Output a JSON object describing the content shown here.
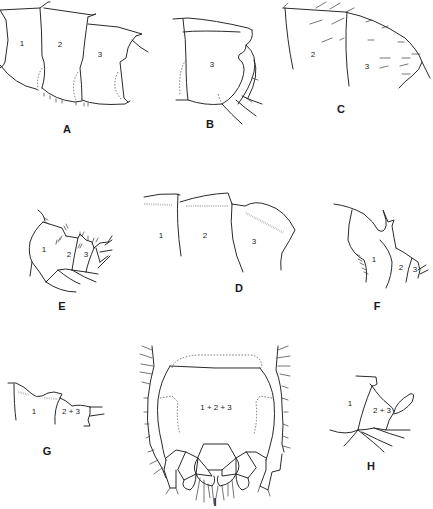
{
  "figure": {
    "panels": [
      {
        "id": "A",
        "label": "A",
        "segments": [
          "1",
          "2",
          "3"
        ]
      },
      {
        "id": "B",
        "label": "B",
        "segments": [
          "3"
        ]
      },
      {
        "id": "C",
        "label": "C",
        "segments": [
          "2",
          "3"
        ]
      },
      {
        "id": "D",
        "label": "D",
        "segments": [
          "1",
          "2",
          "3"
        ]
      },
      {
        "id": "E",
        "label": "E",
        "segments": [
          "1",
          "2",
          "3"
        ]
      },
      {
        "id": "F",
        "label": "F",
        "segments": [
          "1",
          "2",
          "3"
        ]
      },
      {
        "id": "G",
        "label": "G",
        "segments": [
          "1",
          "2 + 3"
        ]
      },
      {
        "id": "H",
        "label": "H",
        "segments": [
          "1",
          "2 + 3"
        ]
      },
      {
        "id": "I",
        "label": "I",
        "segments": [
          "1 + 2 + 3"
        ]
      }
    ],
    "colors": {
      "ink": "#2a2a2a",
      "background": "#ffffff",
      "stipple": "#9a9a9a"
    }
  }
}
